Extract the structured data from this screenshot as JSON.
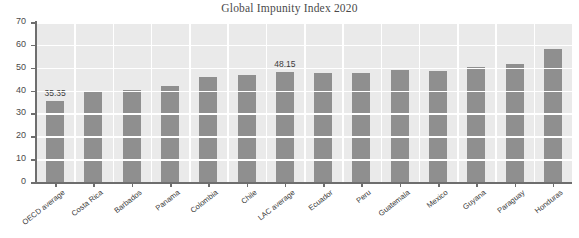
{
  "chart_data": {
    "type": "bar",
    "title": "Global Impunity Index 2020",
    "xlabel": "",
    "ylabel": "",
    "ylim": [
      0,
      70
    ],
    "yticks": [
      0,
      10,
      20,
      30,
      40,
      50,
      60,
      70
    ],
    "grid": true,
    "legend": "none",
    "bar_color": "#8f8f8f",
    "plot_background": "#eaeaea",
    "gridline_color": "#ffffff",
    "categories": [
      "OECD average",
      "Costa Rica",
      "Barbados",
      "Panama",
      "Colombia",
      "Chile",
      "LAC average",
      "Ecuador",
      "Peru",
      "Guatemala",
      "Mexico",
      "Guyana",
      "Paraguay",
      "Honduras"
    ],
    "values": [
      35.35,
      39.2,
      40.1,
      42.0,
      46.0,
      46.8,
      48.15,
      47.6,
      47.6,
      48.8,
      48.6,
      50.4,
      51.6,
      58.4
    ],
    "data_labels": [
      {
        "category": "OECD average",
        "text": "35.35"
      },
      {
        "category": "LAC average",
        "text": "48.15"
      }
    ]
  }
}
